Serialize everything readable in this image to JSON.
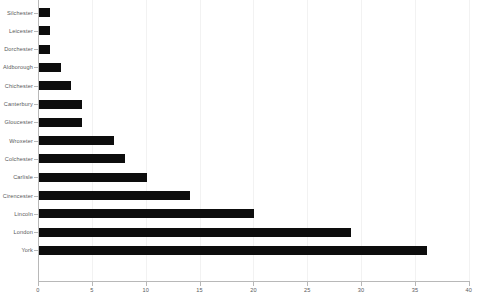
{
  "chart_data": {
    "type": "bar",
    "orientation": "horizontal",
    "title": "",
    "subtitle": "",
    "xlabel": "",
    "ylabel": "",
    "xlim": [
      0,
      40
    ],
    "xticks": [
      0,
      5,
      10,
      15,
      20,
      25,
      30,
      35,
      40
    ],
    "xtick_labels": [
      "0",
      "5",
      "10",
      "15",
      "20",
      "25",
      "30",
      "35",
      "40"
    ],
    "grid": "vertical",
    "legend": null,
    "bar_color": "#0d0d0d",
    "gridline_color": "#f2f2f2",
    "axis_color": "#b8b8b8",
    "label_color": "#58595b",
    "categories": [
      "Silchester",
      "Leicester",
      "Dorchester",
      "Aldborough",
      "Chichester",
      "Canterbury",
      "Gloucester",
      "Wroxeter",
      "Colchester",
      "Carlisle",
      "Cirencester",
      "Lincoln",
      "London",
      "York"
    ],
    "values": [
      1,
      1,
      1,
      2,
      3,
      4,
      4,
      7,
      8,
      10,
      14,
      20,
      29,
      36
    ]
  }
}
